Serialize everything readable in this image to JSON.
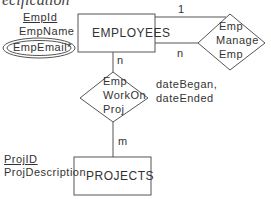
{
  "title_fragment": "ecification",
  "entities": {
    "employees": "EMPLOYEES",
    "projects": "PROJECTS"
  },
  "relationships": {
    "manage": [
      "Emp",
      "Manage",
      "Emp"
    ],
    "workon": [
      "Emp",
      "WorkOn",
      "Proj"
    ]
  },
  "attributes": {
    "employees": {
      "key": "EmpId",
      "name": "EmpName",
      "multivalued": "EmpEmail*"
    },
    "projects": {
      "key": "ProjID",
      "desc": "ProjDescription"
    },
    "workon": [
      "dateBegan,",
      "dateEnded"
    ]
  },
  "cardinalities": {
    "manage_one": "1",
    "manage_n": "n",
    "workon_emp": "n",
    "workon_proj": "m"
  }
}
